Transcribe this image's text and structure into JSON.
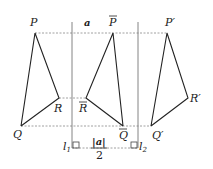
{
  "diagram": {
    "colors": {
      "stroke": "#222222",
      "axis": "#777777",
      "dash": "#888888",
      "background": "#ffffff"
    },
    "labels": {
      "P": "P",
      "Q": "Q",
      "R": "R",
      "Pbar": "P",
      "Qbar": "Q",
      "Rbar": "R",
      "Pprime": "P′",
      "Qprime": "Q′",
      "Rprime": "R′",
      "a": "a",
      "l1": "l",
      "l1_sub": "1",
      "l2": "l",
      "l2_sub": "2",
      "half_a_num": "|a|",
      "half_a_den": "2"
    },
    "points": {
      "P": [
        35,
        33
      ],
      "Q": [
        21,
        126
      ],
      "R": [
        59,
        98
      ],
      "Pbar": [
        113,
        33
      ],
      "Qbar": [
        123,
        126
      ],
      "Rbar": [
        86,
        98
      ],
      "Pprime": [
        167,
        33
      ],
      "Qprime": [
        151,
        126
      ],
      "Rprime": [
        188,
        98
      ]
    },
    "lines": {
      "l1_x": 72,
      "l2_x": 138
    }
  }
}
